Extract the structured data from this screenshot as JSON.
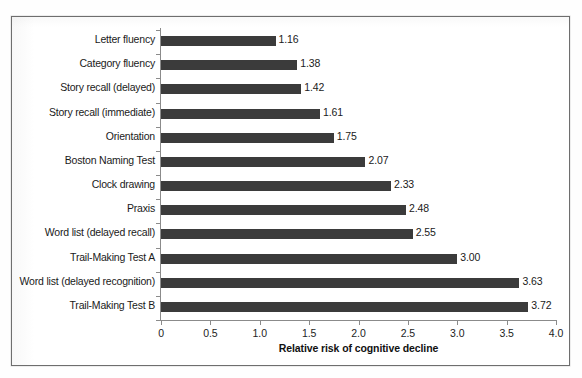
{
  "chart_data": {
    "type": "bar",
    "orientation": "horizontal",
    "title": "",
    "xlabel": "Relative risk of cognitive decline",
    "ylabel": "",
    "xlim": [
      0,
      4.0
    ],
    "xticks": [
      "0",
      "0.5",
      "1.0",
      "1.5",
      "2.0",
      "2.5",
      "3.0",
      "3.5",
      "4.0"
    ],
    "xtick_values": [
      0,
      0.5,
      1.0,
      1.5,
      2.0,
      2.5,
      3.0,
      3.5,
      4.0
    ],
    "grid": false,
    "legend": false,
    "bar_color": "#3b3b3b",
    "categories": [
      "Letter fluency",
      "Category fluency",
      "Story recall (delayed)",
      "Story recall (immediate)",
      "Orientation",
      "Boston Naming Test",
      "Clock drawing",
      "Praxis",
      "Word list (delayed recall)",
      "Trail-Making Test A",
      "Word list (delayed recognition)",
      "Trail-Making Test B"
    ],
    "values": [
      1.16,
      1.38,
      1.42,
      1.61,
      1.75,
      2.07,
      2.33,
      2.48,
      2.55,
      3.0,
      3.63,
      3.72
    ],
    "value_labels": [
      "1.16",
      "1.38",
      "1.42",
      "1.61",
      "1.75",
      "2.07",
      "2.33",
      "2.48",
      "2.55",
      "3.00",
      "3.63",
      "3.72"
    ]
  }
}
